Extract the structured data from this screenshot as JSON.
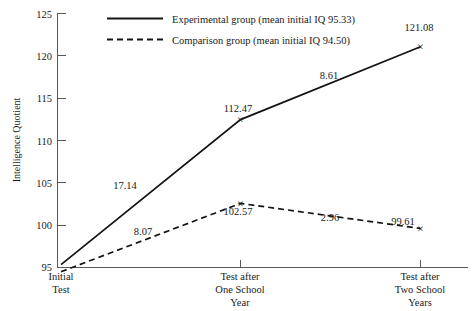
{
  "chart_data": {
    "type": "line",
    "title": "",
    "xlabel": "",
    "ylabel": "Intelligence Quotient",
    "ylim": [
      95,
      125
    ],
    "yticks": [
      95,
      100,
      105,
      110,
      115,
      120,
      125
    ],
    "ytick_labels": [
      "95",
      "100",
      "105",
      "110",
      "115",
      "120",
      "125"
    ],
    "grid": false,
    "legend_position": "top-center",
    "categories": [
      "Initial Test",
      "Test after One School Year",
      "Test after Two School Years"
    ],
    "category_lines": [
      [
        "Initial",
        "Test"
      ],
      [
        "Test after",
        "One School",
        "Year"
      ],
      [
        "Test after",
        "Two School",
        "Years"
      ]
    ],
    "series": [
      {
        "name": "Experimental group (mean initial IQ 95.33)",
        "short_name": "Experimental group",
        "style": "solid",
        "values": [
          95.33,
          112.47,
          121.08
        ],
        "point_labels": [
          "",
          "112.47",
          "121.08"
        ],
        "segment_labels": [
          "17.14",
          "8.61"
        ]
      },
      {
        "name": "Comparison group (mean initial IQ 94.50)",
        "short_name": "Comparison group",
        "style": "dashed",
        "values": [
          94.5,
          102.57,
          99.61
        ],
        "point_labels": [
          "",
          "102.57",
          "99.61"
        ],
        "segment_labels": [
          "8.07",
          "2.96"
        ]
      }
    ],
    "marker_glyph": "×",
    "colors": {
      "series_line": "#141414",
      "axis": "#585858",
      "text": "#1a1a1a",
      "background": "#ffffff"
    }
  },
  "legend": {
    "entries": [
      {
        "label": "Experimental group (mean initial IQ 95.33)",
        "style": "solid"
      },
      {
        "label": "Comparison group (mean initial IQ 94.50)",
        "style": "dashed"
      }
    ]
  },
  "axes": {
    "y_title": "Intelligence Quotient",
    "y_tick_labels": [
      "125",
      "120",
      "115",
      "110",
      "105",
      "100",
      "95"
    ],
    "x_category_labels": [
      [
        "Initial",
        "Test"
      ],
      [
        "Test after",
        "One School",
        "Year"
      ],
      [
        "Test after",
        "Two School",
        "Years"
      ]
    ]
  },
  "annotations": {
    "experimental": {
      "mid_point": "112.47",
      "end_point": "121.08",
      "gain_first": "17.14",
      "gain_second": "8.61"
    },
    "comparison": {
      "mid_point": "102.57",
      "end_point": "99.61",
      "gain_first": "8.07",
      "gain_second": "2.96"
    }
  }
}
